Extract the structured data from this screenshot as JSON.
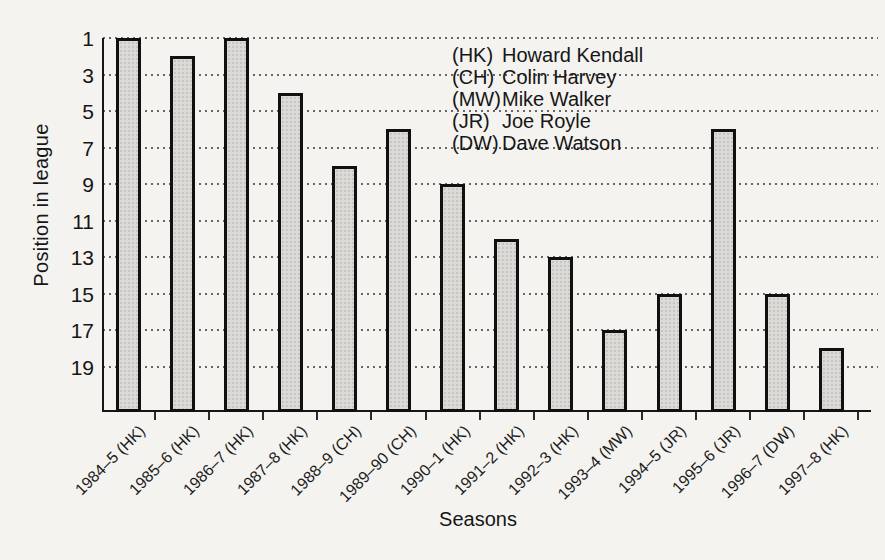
{
  "chart_data": {
    "type": "bar",
    "title": "",
    "xlabel": "Seasons",
    "ylabel": "Position in league",
    "categories": [
      "1984–5 (HK)",
      "1985–6 (HK)",
      "1986–7 (HK)",
      "1987–8 (HK)",
      "1988–9 (CH)",
      "1989–90 (CH)",
      "1990–1 (HK)",
      "1991–2 (HK)",
      "1992–3 (HK)",
      "1993–4 (MW)",
      "1994–5 (JR)",
      "1995–6 (JR)",
      "1996–7 (DW)",
      "1997–8 (HK)"
    ],
    "values": [
      1,
      2,
      1,
      4,
      8,
      6,
      9,
      12,
      13,
      17,
      15,
      6,
      15,
      18
    ],
    "y_ticks": [
      1,
      3,
      5,
      7,
      9,
      11,
      13,
      15,
      17,
      19
    ],
    "y_axis_inverted": true,
    "ylim": [
      1,
      21.4
    ],
    "grid": "horizontal-dotted",
    "legend_position": "top-right",
    "bar_fill_color": "#dbdad6",
    "bar_border_color": "#101010",
    "background_color": "#f4f3f0",
    "legend": [
      {
        "code": "(HK)",
        "name": "Howard Kendall"
      },
      {
        "code": "(CH)",
        "name": "Colin Harvey"
      },
      {
        "code": "(MW)",
        "name": "Mike Walker"
      },
      {
        "code": "(JR)",
        "name": "Joe Royle"
      },
      {
        "code": "(DW)",
        "name": "Dave Watson"
      }
    ]
  }
}
